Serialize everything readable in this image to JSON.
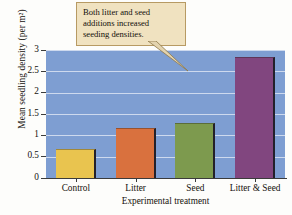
{
  "chart_data": {
    "type": "bar",
    "title": "",
    "xlabel": "Experimental treatment",
    "ylabel": "Mean seedling density (per m²)",
    "categories": [
      "Control",
      "Litter",
      "Seed",
      "Litter & Seed"
    ],
    "values": [
      0.67,
      1.18,
      1.28,
      2.83
    ],
    "colors": [
      "#e9c44f",
      "#d9713e",
      "#7d9a4e",
      "#81467f"
    ],
    "ylim": [
      0,
      3
    ],
    "yticks": [
      "0",
      "0.5",
      "1",
      "1.5",
      "2",
      "2.5",
      "3"
    ],
    "ytick_values": [
      0,
      0.5,
      1,
      1.5,
      2,
      2.5,
      3
    ],
    "grid": "horizontal",
    "legend": "none",
    "plot_background": "#7e9ed2",
    "gridline_color": "#cdd9ee",
    "annotations": [
      {
        "text": "Both litter and seed additions increased seeding densities.",
        "style": "callout-box",
        "background": "#f0e2c0",
        "border": "#b79a63",
        "points_to": "plot-area"
      }
    ]
  },
  "callout": {
    "line1": "Both litter and seed",
    "line2": "additions increased",
    "line3": "seeding densities."
  }
}
